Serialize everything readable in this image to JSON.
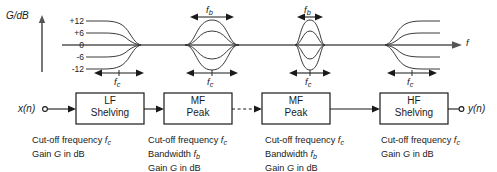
{
  "figure": {
    "type": "block-diagram-with-frequency-response",
    "background": "#ffffff",
    "line_color": "#1a1a1a"
  },
  "response_plot": {
    "y_axis_label": "G/dB",
    "y_ticks": [
      "+12",
      "+6",
      "0",
      "-6",
      "-12"
    ],
    "x_axis_label": "f",
    "sections": [
      {
        "name": "lf-shelving-response",
        "bandwidth_label": null,
        "cutoff_label": "f",
        "cutoff_sub": "c"
      },
      {
        "name": "mf-peak-wide-response",
        "bandwidth_label": "f",
        "bandwidth_sub": "b",
        "cutoff_label": "f",
        "cutoff_sub": "c"
      },
      {
        "name": "mf-peak-narrow-response",
        "bandwidth_label": "f",
        "bandwidth_sub": "b",
        "cutoff_label": "f",
        "cutoff_sub": "c"
      },
      {
        "name": "hf-shelving-response",
        "bandwidth_label": null,
        "cutoff_label": "f",
        "cutoff_sub": "c"
      }
    ]
  },
  "signal_chain": {
    "input_label": "x(n)",
    "output_label": "y(n)",
    "blocks": [
      {
        "line1": "LF",
        "line2": "Shelving"
      },
      {
        "line1": "MF",
        "line2": "Peak"
      },
      {
        "line1": "MF",
        "line2": "Peak"
      },
      {
        "line1": "HF",
        "line2": "Shelving"
      }
    ]
  },
  "captions": [
    {
      "name": "lf-shelving-caption",
      "lines": [
        {
          "pre": "Cut-off frequency ",
          "sym": "f",
          "sub": "c",
          "post": ""
        },
        {
          "pre": "Gain ",
          "sym": "G",
          "sub": "",
          "post": " in dB"
        }
      ]
    },
    {
      "name": "mf-peak-1-caption",
      "lines": [
        {
          "pre": "Cut-off frequency ",
          "sym": "f",
          "sub": "c",
          "post": ""
        },
        {
          "pre": "Bandwidth ",
          "sym": "f",
          "sub": "b",
          "post": ""
        },
        {
          "pre": "Gain ",
          "sym": "G",
          "sub": "",
          "post": " in dB"
        }
      ]
    },
    {
      "name": "mf-peak-2-caption",
      "lines": [
        {
          "pre": "Cut-off frequency ",
          "sym": "f",
          "sub": "c",
          "post": ""
        },
        {
          "pre": "Bandwidth ",
          "sym": "f",
          "sub": "b",
          "post": ""
        },
        {
          "pre": "Gain ",
          "sym": "G",
          "sub": "",
          "post": " in dB"
        }
      ]
    },
    {
      "name": "hf-shelving-caption",
      "lines": [
        {
          "pre": "Cut-off frequency ",
          "sym": "f",
          "sub": "c",
          "post": ""
        },
        {
          "pre": "Gain ",
          "sym": "G",
          "sub": "",
          "post": " in dB"
        }
      ]
    }
  ]
}
